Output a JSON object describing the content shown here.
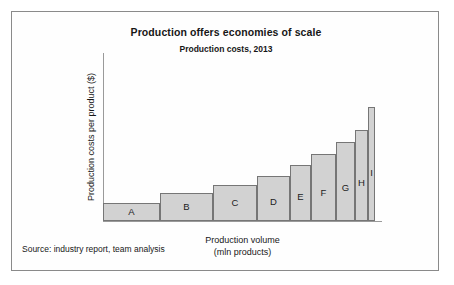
{
  "chart_data": {
    "type": "bar",
    "title": "Production offers economies of scale",
    "subtitle": "Production costs, 2013",
    "xlabel_line1": "Production volume",
    "xlabel_line2": "(mln products)",
    "ylabel": "Production costs per product ($)",
    "source": "Source: industry report, team analysis",
    "grid": false,
    "legend": "none",
    "axis_ticks": "none",
    "note": "Variable-width (Marimekko-style) bar chart: bar width encodes production volume, bar height encodes production cost per product. Values are unlabeled and estimated from pixel geometry.",
    "categories": [
      "A",
      "B",
      "C",
      "D",
      "E",
      "F",
      "G",
      "H",
      "I"
    ],
    "values": [
      18,
      28,
      36,
      45,
      56,
      67,
      79,
      91,
      114
    ],
    "widths": [
      57,
      53,
      44,
      33,
      21,
      25,
      19,
      13,
      7
    ],
    "ylim": [
      0,
      168
    ],
    "xlim": [
      0,
      272
    ],
    "colors": {
      "bar_fill": "#d2d2d2",
      "bar_stroke": "#767676",
      "axis": "#9a9a9a",
      "text": "#171717",
      "frame": "#8a8a8a",
      "background": "#ffffff"
    }
  }
}
